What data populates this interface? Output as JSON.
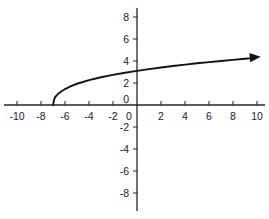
{
  "chart_data": {
    "type": "line",
    "title": "",
    "subtitle": "",
    "xlabel": "",
    "ylabel": "",
    "xlim": [
      -11,
      11
    ],
    "ylim": [
      -9,
      9
    ],
    "grid": false,
    "legend": null,
    "x_ticks": [
      -10,
      -8,
      -6,
      -4,
      -2,
      0,
      2,
      4,
      6,
      8,
      10
    ],
    "y_ticks": [
      8,
      6,
      4,
      2,
      0,
      -2,
      -4,
      -6,
      -8
    ],
    "x_tick_labels": [
      "-10",
      "-8",
      "-6",
      "-4",
      "-2",
      "0",
      "2",
      "4",
      "6",
      "8",
      "10"
    ],
    "y_tick_labels": [
      "8",
      "6",
      "4",
      "2",
      "0",
      "-2",
      "-4",
      "-6",
      "-8"
    ],
    "annotations": [
      {
        "name": "arrow-head",
        "at_x": 9.4,
        "at_y": 4.3,
        "direction": "right"
      }
    ],
    "series": [
      {
        "name": "square-root-curve",
        "color": "#111111",
        "start_point": [
          -7,
          0
        ],
        "end_point": [
          9.4,
          4.3
        ],
        "x": [
          -7.0,
          -6.9,
          -6.8,
          -6.6,
          -6.4,
          -6.0,
          -5.5,
          -5.0,
          -4.0,
          -3.0,
          -2.0,
          -1.0,
          0.0,
          1.0,
          2.0,
          3.0,
          4.0,
          5.0,
          6.0,
          7.0,
          8.0,
          9.0,
          9.4
        ],
        "values": [
          0.0,
          0.53,
          0.74,
          0.99,
          1.16,
          1.45,
          1.71,
          1.93,
          2.26,
          2.52,
          2.74,
          2.93,
          3.1,
          3.26,
          3.41,
          3.54,
          3.67,
          3.79,
          3.9,
          4.0,
          4.1,
          4.2,
          4.24
        ]
      }
    ]
  },
  "figure": {
    "origin_label": "0",
    "axis_color": "#262626",
    "curve_color": "#111111",
    "background_color": "#ffffff"
  }
}
